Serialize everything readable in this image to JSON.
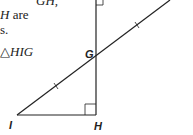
{
  "text_fragments": [
    {
      "text": "GH,",
      "x": 44,
      "y": -6
    },
    {
      "text": "H are",
      "x": 0,
      "y": 6
    },
    {
      "text": "s.",
      "x": 0,
      "y": 22
    },
    {
      "text": "△HIG",
      "x": 0,
      "y": 43
    }
  ],
  "diagram": {
    "labels": {
      "G": "G",
      "I": "I",
      "H": "H"
    },
    "stroke": "#222222"
  }
}
